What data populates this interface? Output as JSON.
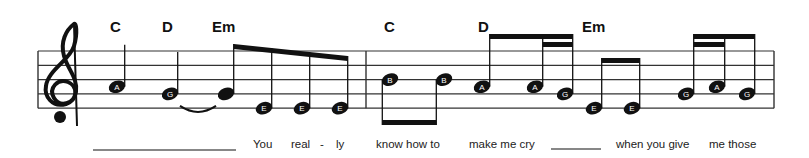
{
  "score": {
    "clef": "treble",
    "chords": [
      {
        "label": "C",
        "beat_note": 0
      },
      {
        "label": "D",
        "beat_note": 1
      },
      {
        "label": "Em",
        "beat_note": 2
      },
      {
        "label": "C",
        "beat_note": 6
      },
      {
        "label": "D",
        "beat_note": 8
      },
      {
        "label": "Em",
        "beat_note": 11
      }
    ],
    "measures": [
      {
        "notes": [
          {
            "pitch": "A",
            "label": "A",
            "duration": "quarter"
          },
          {
            "pitch": "G",
            "label": "G",
            "duration": "quarter",
            "tie_to_next": true
          },
          {
            "pitch": "G",
            "label": "",
            "duration": "eighth",
            "beam_group": 1
          },
          {
            "pitch": "E",
            "label": "E",
            "duration": "eighth",
            "beam_group": 1
          },
          {
            "pitch": "E",
            "label": "E",
            "duration": "eighth",
            "beam_group": 1
          },
          {
            "pitch": "E",
            "label": "E",
            "duration": "eighth",
            "beam_group": 1
          }
        ]
      },
      {
        "notes": [
          {
            "pitch": "B",
            "label": "B",
            "duration": "eighth",
            "beam_group": 2,
            "stem": "down"
          },
          {
            "pitch": "B",
            "label": "B",
            "duration": "eighth",
            "beam_group": 2,
            "stem": "down"
          },
          {
            "pitch": "A",
            "label": "A",
            "duration": "eighth",
            "beam_group": 3
          },
          {
            "pitch": "A",
            "label": "A",
            "duration": "sixteenth",
            "beam_group": 3
          },
          {
            "pitch": "G",
            "label": "G",
            "duration": "sixteenth",
            "beam_group": 3
          },
          {
            "pitch": "E",
            "label": "E",
            "duration": "eighth",
            "beam_group": 4
          },
          {
            "pitch": "E",
            "label": "E",
            "duration": "eighth",
            "beam_group": 4
          },
          {
            "pitch": "G",
            "label": "G",
            "duration": "sixteenth",
            "beam_group": 5
          },
          {
            "pitch": "A",
            "label": "A",
            "duration": "sixteenth",
            "beam_group": 5
          },
          {
            "pitch": "G",
            "label": "G",
            "duration": "eighth",
            "beam_group": 5
          }
        ]
      }
    ],
    "lyrics": [
      {
        "text": "",
        "blank": true
      },
      {
        "text": "You"
      },
      {
        "text": "real"
      },
      {
        "text": "-"
      },
      {
        "text": "ly"
      },
      {
        "text": "know how to"
      },
      {
        "text": "make me cry"
      },
      {
        "text": "",
        "blank": true
      },
      {
        "text": "when you give"
      },
      {
        "text": "me those"
      }
    ]
  }
}
